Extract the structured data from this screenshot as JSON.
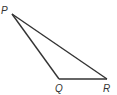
{
  "diagram": {
    "type": "triangle",
    "vertices": [
      {
        "name": "P",
        "label": "P"
      },
      {
        "name": "Q",
        "label": "Q"
      },
      {
        "name": "R",
        "label": "R"
      }
    ],
    "edges": [
      {
        "from": "P",
        "to": "Q"
      },
      {
        "from": "Q",
        "to": "R"
      },
      {
        "from": "R",
        "to": "P"
      }
    ],
    "line_color": "#333333"
  }
}
